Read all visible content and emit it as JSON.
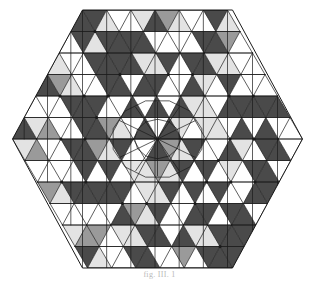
{
  "figure": {
    "caption": "fig. III.  1",
    "canvas": {
      "width": 319,
      "height": 286,
      "background": "#ffffff"
    },
    "geometry": {
      "shape": "hexagon",
      "orientation": "flat-top-pointy-side",
      "center_x": 157.5,
      "center_y": 139,
      "radius_x": 145,
      "radius_y": 129,
      "half_width_top": 75,
      "subdivisions_per_edge": 6,
      "symmetry": "6-fold rotational with mirror axes (p6m)",
      "center_rosette_rays": 12
    },
    "palette": {
      "fill_white": "#ffffff",
      "fill_light": "#e3e3e3",
      "fill_medium": "#9a9a9a",
      "fill_dark": "#4a4a4a",
      "stroke": "#1a1a1a",
      "stroke_width": 0.7,
      "caption_color": "#b9b9b9"
    },
    "shade_legend": [
      {
        "name": "white",
        "value": 0,
        "hex": "#ffffff"
      },
      {
        "name": "light-gray",
        "value": 1,
        "hex": "#e3e3e3"
      },
      {
        "name": "medium-gray",
        "value": 2,
        "hex": "#9a9a9a"
      },
      {
        "name": "dark-gray",
        "value": 3,
        "hex": "#4a4a4a"
      }
    ],
    "sector_shade_map": {
      "description": "Shade index per cell of one 60-degree sector, in triangular lattice coordinates (ring, position). Mirrored and rotated 6x to fill the hexagon.",
      "rings": [
        [
          3,
          2,
          3,
          0,
          1,
          0
        ],
        [
          0,
          3,
          1,
          3,
          0,
          1
        ],
        [
          1,
          0,
          3,
          2,
          3,
          0
        ],
        [
          3,
          1,
          0,
          3,
          1,
          3
        ],
        [
          0,
          3,
          2,
          0,
          3,
          0
        ],
        [
          2,
          0,
          3,
          1,
          0,
          1
        ]
      ]
    },
    "grid": {
      "square_motif_rows": 6,
      "square_motif_cols": 6,
      "diagonals": "both",
      "node_dots": true,
      "node_dot_radius": 1.6
    }
  }
}
